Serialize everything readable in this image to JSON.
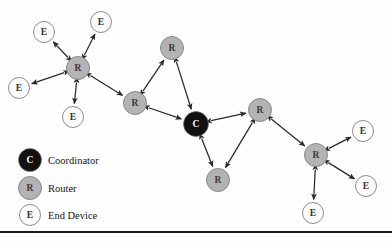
{
  "diagram": {
    "type": "network-topology",
    "canvas": {
      "width": 392,
      "height": 246
    },
    "colors": {
      "coordinator_fill": "#111111",
      "coordinator_text": "#ffffff",
      "router_fill": "#b3b3b3",
      "router_text": "#3a3a3a",
      "end_device_fill": "#fdfdfd",
      "end_device_text": "#333333",
      "node_stroke": "#808080",
      "link_color": "#2a2a2a",
      "rule_color": "#1a1a1a",
      "background": "#fefefe"
    },
    "nodes": [
      {
        "id": "R1",
        "label": "R",
        "role": "router",
        "x": 78,
        "y": 68,
        "r": 11.5
      },
      {
        "id": "E1",
        "label": "E",
        "role": "end-device",
        "x": 44,
        "y": 32,
        "r": 10.5
      },
      {
        "id": "E2",
        "label": "E",
        "role": "end-device",
        "x": 101,
        "y": 22,
        "r": 10.5
      },
      {
        "id": "E3",
        "label": "E",
        "role": "end-device",
        "x": 19,
        "y": 88,
        "r": 10.5
      },
      {
        "id": "E4",
        "label": "E",
        "role": "end-device",
        "x": 73,
        "y": 117,
        "r": 10.5
      },
      {
        "id": "R2",
        "label": "R",
        "role": "router",
        "x": 135,
        "y": 103,
        "r": 11.5
      },
      {
        "id": "R3",
        "label": "R",
        "role": "router",
        "x": 172,
        "y": 48,
        "r": 11.5
      },
      {
        "id": "C1",
        "label": "C",
        "role": "coordinator",
        "x": 196,
        "y": 124,
        "r": 12.5
      },
      {
        "id": "R4",
        "label": "R",
        "role": "router",
        "x": 260,
        "y": 110,
        "r": 11.5
      },
      {
        "id": "R5",
        "label": "R",
        "role": "router",
        "x": 218,
        "y": 180,
        "r": 11.5
      },
      {
        "id": "R6",
        "label": "R",
        "role": "router",
        "x": 316,
        "y": 155,
        "r": 11.5
      },
      {
        "id": "E5",
        "label": "E",
        "role": "end-device",
        "x": 363,
        "y": 131,
        "r": 10.5
      },
      {
        "id": "E6",
        "label": "E",
        "role": "end-device",
        "x": 366,
        "y": 186,
        "r": 10.5
      },
      {
        "id": "E7",
        "label": "E",
        "role": "end-device",
        "x": 313,
        "y": 213,
        "r": 10.5
      }
    ],
    "links": [
      {
        "from": "R1",
        "to": "E1",
        "arrows": "both"
      },
      {
        "from": "R1",
        "to": "E2",
        "arrows": "both"
      },
      {
        "from": "R1",
        "to": "E3",
        "arrows": "both"
      },
      {
        "from": "R1",
        "to": "E4",
        "arrows": "both"
      },
      {
        "from": "R1",
        "to": "R2",
        "arrows": "both"
      },
      {
        "from": "R2",
        "to": "R3",
        "arrows": "both"
      },
      {
        "from": "R2",
        "to": "C1",
        "arrows": "both"
      },
      {
        "from": "R3",
        "to": "C1",
        "arrows": "both"
      },
      {
        "from": "C1",
        "to": "R4",
        "arrows": "both"
      },
      {
        "from": "C1",
        "to": "R5",
        "arrows": "both"
      },
      {
        "from": "R4",
        "to": "R5",
        "arrows": "both"
      },
      {
        "from": "R4",
        "to": "R6",
        "arrows": "both"
      },
      {
        "from": "R6",
        "to": "E5",
        "arrows": "both"
      },
      {
        "from": "R6",
        "to": "E6",
        "arrows": "both"
      },
      {
        "from": "R6",
        "to": "E7",
        "arrows": "both"
      }
    ]
  },
  "legend": {
    "items": [
      {
        "id": "legend-coordinator",
        "symbol": "C",
        "label": "Coordinator",
        "role": "coordinator",
        "x": 30,
        "y": 160,
        "r": 11.5
      },
      {
        "id": "legend-router",
        "symbol": "R",
        "label": "Router",
        "role": "router",
        "x": 30,
        "y": 188,
        "r": 11.5
      },
      {
        "id": "legend-end-device",
        "symbol": "E",
        "label": "End Device",
        "role": "end-device",
        "x": 30,
        "y": 215,
        "r": 10.5
      }
    ],
    "text_x": 48
  },
  "footer_rule": {
    "y": 232,
    "thickness": 2.2,
    "x1": 0,
    "x2": 392
  }
}
